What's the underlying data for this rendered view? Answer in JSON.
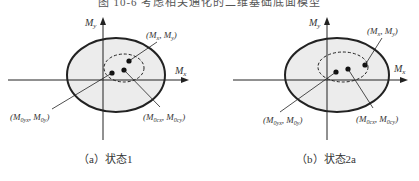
{
  "figure": {
    "title": "图 10-6  考虑相关通化的二维基础底面模型"
  },
  "panels": [
    {
      "id": "a",
      "caption": "（a）状态1",
      "axis_x_label": "Mx",
      "axis_y_label": "My",
      "point_labels": {
        "load": "(Mx, My)",
        "origin_shift": "(M0yx, M0y)",
        "center": "(M0cx, M0cy)"
      }
    },
    {
      "id": "b",
      "caption": "（b）状态2a",
      "axis_x_label": "Mx",
      "axis_y_label": "My",
      "point_labels": {
        "load": "(Mx, My)",
        "origin_shift": "(M0yx, M0y)",
        "center": "(M0cx, M0cy)"
      }
    }
  ],
  "colors": {
    "ellipse_fill": "#ececec",
    "stroke": "#222222"
  }
}
